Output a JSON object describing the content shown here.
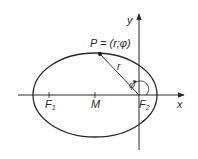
{
  "diagram": {
    "point_label": "P = (r;φ)",
    "radius_label": "r",
    "angle_label": "φ",
    "x_axis_label": "x",
    "y_axis_label": "y",
    "focus1_label": "F",
    "focus1_sub": "1",
    "focus2_label": "F",
    "focus2_sub": "2",
    "center_label": "M"
  },
  "colors": {
    "stroke": "#2a2a2a",
    "background": "#ffffff"
  }
}
